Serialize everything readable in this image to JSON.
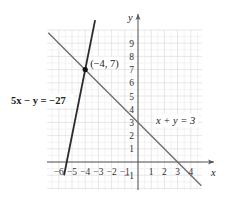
{
  "chart_data": {
    "type": "line",
    "title": "",
    "xlabel": "x",
    "ylabel": "y",
    "xlim": [
      -6.9,
      4.8
    ],
    "ylim": [
      -2,
      10
    ],
    "grid": true,
    "x_ticks": [
      "-6",
      "-5",
      "-4",
      "-3",
      "-2",
      "-1",
      "1",
      "2",
      "3",
      "4"
    ],
    "y_ticks": [
      "-1",
      "1",
      "2",
      "3",
      "4",
      "5",
      "6",
      "7",
      "8",
      "9"
    ],
    "series": [
      {
        "name": "5x − y = −27",
        "equation": "y = 5x + 27",
        "points": [
          [
            -5.6,
            -1
          ],
          [
            -3.25,
            10.75
          ]
        ],
        "color": "#2b2b2b"
      },
      {
        "name": "x + y = 3",
        "equation": "y = 3 − x",
        "points": [
          [
            -6.8,
            9.8
          ],
          [
            4.8,
            -1.8
          ]
        ],
        "color": "#6e6e6e"
      }
    ],
    "annotations": [
      {
        "text": "(−4, 7)",
        "x": -4,
        "y": 7,
        "type": "intersection-point"
      }
    ]
  },
  "labels": {
    "x_axis": "x",
    "y_axis": "y",
    "line1": "5x − y = −27",
    "line2": "x + y = 3",
    "point": "(−4, 7)"
  }
}
